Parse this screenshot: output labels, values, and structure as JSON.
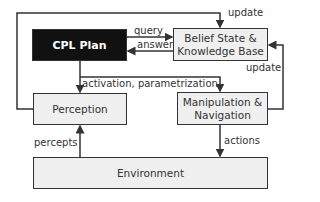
{
  "nodes": {
    "cpl_plan": "CPL Plan",
    "belief_state": "Belief State & Knowledge Base",
    "belief_state_line1": "Belief State &",
    "belief_state_line2": "Knowledge Base",
    "perception": "Perception",
    "manipulation_line1": "Manipulation &",
    "manipulation_line2": "Navigation",
    "environment": "Environment"
  },
  "edges": {
    "query": "query",
    "answer": "answer",
    "activation": "activation, parametrization",
    "update_top": "update",
    "update_right": "update",
    "percepts": "percepts",
    "actions": "actions"
  },
  "colors": {
    "line": "#333333",
    "box_fill": "#efefef",
    "dark_fill": "#111111"
  }
}
